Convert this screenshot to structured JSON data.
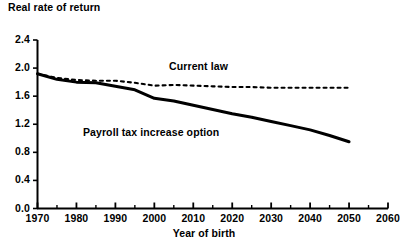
{
  "chart_data": {
    "type": "line",
    "title": "",
    "ylabel": "Real rate of return",
    "xlabel": "Year of birth",
    "xlim": [
      1970,
      2060
    ],
    "ylim": [
      0.0,
      2.4
    ],
    "grid": false,
    "legend_position": "inline-annotations",
    "x_ticks": [
      "1970",
      "1980",
      "1990",
      "2000",
      "2010",
      "2020",
      "2030",
      "2040",
      "2050",
      "2060"
    ],
    "x_tick_values": [
      1970,
      1980,
      1990,
      2000,
      2010,
      2020,
      2030,
      2040,
      2050,
      2060
    ],
    "x_minor_tick_values": [
      1975,
      1985,
      1995,
      2005,
      2015,
      2025,
      2035,
      2045,
      2055
    ],
    "y_ticks": [
      "0.0",
      "0.4",
      "0.8",
      "1.2",
      "1.6",
      "2.0",
      "2.4"
    ],
    "y_tick_values": [
      0.0,
      0.4,
      0.8,
      1.2,
      1.6,
      2.0,
      2.4
    ],
    "x": [
      1970,
      1975,
      1980,
      1985,
      1990,
      1995,
      2000,
      2005,
      2010,
      2015,
      2020,
      2025,
      2030,
      2035,
      2040,
      2045,
      2050
    ],
    "series": [
      {
        "name": "Current law",
        "style": "dashed",
        "color": "#000000",
        "label_x": 2012,
        "label_y": 2.02,
        "values": [
          1.92,
          1.86,
          1.83,
          1.82,
          1.82,
          1.79,
          1.75,
          1.76,
          1.75,
          1.74,
          1.73,
          1.73,
          1.72,
          1.72,
          1.72,
          1.72,
          1.72
        ]
      },
      {
        "name": "Payroll tax increase option",
        "style": "solid",
        "color": "#000000",
        "label_x": 1994,
        "label_y": 1.07,
        "values": [
          1.92,
          1.84,
          1.8,
          1.79,
          1.74,
          1.69,
          1.57,
          1.53,
          1.47,
          1.41,
          1.35,
          1.3,
          1.24,
          1.18,
          1.12,
          1.04,
          0.95
        ]
      }
    ]
  },
  "axes": {
    "y_title": "Real rate of return",
    "x_title": "Year of birth"
  }
}
